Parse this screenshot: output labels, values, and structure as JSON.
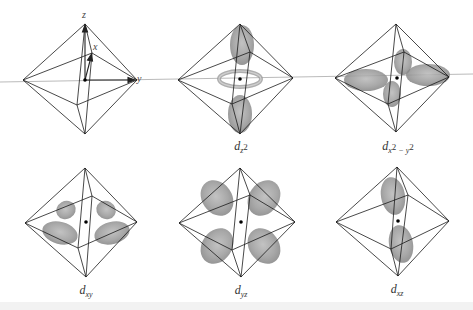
{
  "figure": {
    "axes": {
      "z_label": "z",
      "x_label": "x",
      "y_label": "y"
    },
    "colors": {
      "edge": "#1a1a1a",
      "lobe": "#8c8c8c",
      "axis_line": "#9a9a9a",
      "background": "#ffffff"
    },
    "panels": [
      {
        "id": "axes",
        "label": ""
      },
      {
        "id": "dz2",
        "label_main": "d",
        "label_sub": "z",
        "label_sup": "2"
      },
      {
        "id": "dx2-y2",
        "label_main": "d",
        "label_sub1": "x",
        "label_sup1": "2",
        "label_sub2": " − y",
        "label_sup2": "2"
      },
      {
        "id": "dxy",
        "label_main": "d",
        "label_sub": "xy"
      },
      {
        "id": "dyz",
        "label_main": "d",
        "label_sub": "yz"
      },
      {
        "id": "dxz",
        "label_main": "d",
        "label_sub": "xz"
      }
    ]
  }
}
